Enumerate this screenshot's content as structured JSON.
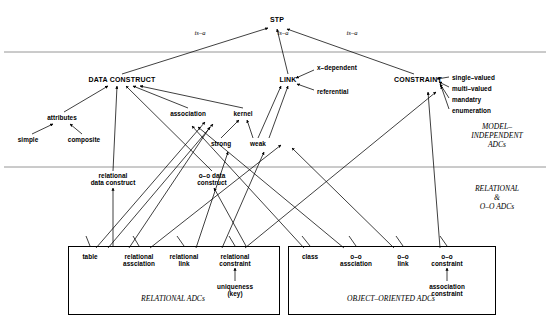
{
  "diagram": {
    "root": {
      "label": "STP",
      "x": 277,
      "y": 22
    },
    "edge_labels": [
      {
        "text": "is–a",
        "x": 200,
        "y": 33
      },
      {
        "text": "is–a",
        "x": 283,
        "y": 33
      },
      {
        "text": "is–a",
        "x": 352,
        "y": 33
      }
    ],
    "zone_labels": [
      {
        "text": "MODEL–\nINDEPENDENT\nADCs",
        "x": 497,
        "y": 130
      },
      {
        "text": "RELATIONAL\n&\nO–O ADCs",
        "x": 497,
        "y": 192
      }
    ],
    "separators": [
      {
        "y": 52,
        "x1": 4,
        "x2": 546
      },
      {
        "y": 167,
        "x1": 4,
        "x2": 546
      }
    ],
    "nodes": [
      {
        "id": "data-construct",
        "label": "DATA CONSTRUCT",
        "x": 122,
        "y": 80,
        "align": "ctr",
        "size": "big"
      },
      {
        "id": "link",
        "label": "LINK",
        "x": 288,
        "y": 80,
        "align": "ctr",
        "size": "big"
      },
      {
        "id": "constraint",
        "label": "CONSTRAINT",
        "x": 418,
        "y": 80,
        "align": "ctr",
        "size": "big"
      },
      {
        "id": "x-dependent",
        "label": "x–dependent",
        "x": 317,
        "y": 68,
        "align": "lft",
        "size": "sm"
      },
      {
        "id": "referential",
        "label": "referential",
        "x": 317,
        "y": 92,
        "align": "lft",
        "size": "sm"
      },
      {
        "id": "single-valued",
        "label": "single–valued",
        "x": 452,
        "y": 78,
        "align": "lft",
        "size": "sm"
      },
      {
        "id": "multi-valued",
        "label": "multi–valued",
        "x": 452,
        "y": 89,
        "align": "lft",
        "size": "sm"
      },
      {
        "id": "mandatry",
        "label": "mandatry",
        "x": 452,
        "y": 100,
        "align": "lft",
        "size": "sm"
      },
      {
        "id": "enumeration",
        "label": "enumeration",
        "x": 452,
        "y": 111,
        "align": "lft",
        "size": "sm"
      },
      {
        "id": "attributes",
        "label": "attributes",
        "x": 62,
        "y": 118,
        "align": "ctr",
        "size": "sm"
      },
      {
        "id": "simple",
        "label": "simple",
        "x": 28,
        "y": 140,
        "align": "ctr",
        "size": "sm"
      },
      {
        "id": "composite",
        "label": "composite",
        "x": 84,
        "y": 140,
        "align": "ctr",
        "size": "sm"
      },
      {
        "id": "association",
        "label": "association",
        "x": 188,
        "y": 114,
        "align": "ctr",
        "size": "sm"
      },
      {
        "id": "kernel",
        "label": "kernel",
        "x": 243,
        "y": 114,
        "align": "ctr",
        "size": "sm"
      },
      {
        "id": "strong",
        "label": "strong",
        "x": 221,
        "y": 144,
        "align": "ctr",
        "size": "sm"
      },
      {
        "id": "weak",
        "label": "weak",
        "x": 258,
        "y": 144,
        "align": "ctr",
        "size": "sm"
      },
      {
        "id": "relational-data-construct",
        "label": "relational\ndata construct",
        "x": 113,
        "y": 177,
        "align": "ctr",
        "size": "sm"
      },
      {
        "id": "oo-data-construct",
        "label": "o–o data\nconstruct",
        "x": 212,
        "y": 177,
        "align": "ctr",
        "size": "sm"
      },
      {
        "id": "table",
        "label": "table",
        "x": 90,
        "y": 257,
        "align": "ctr",
        "size": "sm"
      },
      {
        "id": "relational-assciation",
        "label": "relational\nassciation",
        "x": 139,
        "y": 257,
        "align": "ctr",
        "size": "sm"
      },
      {
        "id": "relational-link",
        "label": "relational\nlink",
        "x": 184,
        "y": 257,
        "align": "ctr",
        "size": "sm"
      },
      {
        "id": "relational-constraint",
        "label": "relational\nconstraint",
        "x": 235,
        "y": 257,
        "align": "ctr",
        "size": "sm"
      },
      {
        "id": "uniqueness-key",
        "label": "uniqueness\n(key)",
        "x": 235,
        "y": 287,
        "align": "ctr",
        "size": "sm"
      },
      {
        "id": "class",
        "label": "class",
        "x": 310,
        "y": 257,
        "align": "ctr",
        "size": "sm"
      },
      {
        "id": "oo-assciation",
        "label": "o–o\nassciation",
        "x": 356,
        "y": 257,
        "align": "ctr",
        "size": "sm"
      },
      {
        "id": "oo-link",
        "label": "o–o\nlink",
        "x": 403,
        "y": 257,
        "align": "ctr",
        "size": "sm"
      },
      {
        "id": "oo-constraint",
        "label": "o–o\nconstraint",
        "x": 447,
        "y": 257,
        "align": "ctr",
        "size": "sm"
      },
      {
        "id": "association-constraint",
        "label": "association\nconstraint",
        "x": 447,
        "y": 287,
        "align": "ctr",
        "size": "sm"
      }
    ],
    "boxes": [
      {
        "id": "relational-adcs-box",
        "label": "RELATIONAL ADCs",
        "x": 68,
        "y": 246,
        "w": 210,
        "h": 67,
        "label_x": 173,
        "label_y": 298
      },
      {
        "id": "object-oriented-adcs-box",
        "label": "OBJECT–ORIENTED ADCs",
        "x": 288,
        "y": 246,
        "w": 206,
        "h": 67,
        "label_x": 391,
        "label_y": 298
      }
    ]
  },
  "colors": {
    "line": "#000000",
    "separator": "#888888",
    "background": "#ffffff",
    "text": "#000000"
  }
}
